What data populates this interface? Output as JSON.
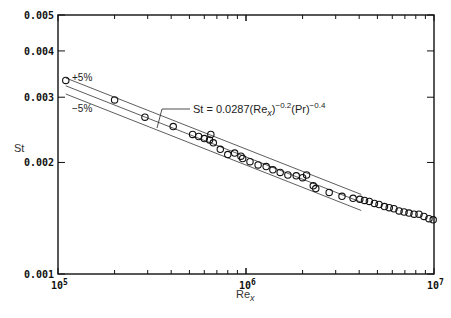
{
  "chart_data": {
    "type": "scatter",
    "title": "",
    "xlabel": "Re",
    "xlabel_sub": "x",
    "ylabel": "St",
    "xscale": "log",
    "yscale": "log",
    "xlim": [
      100000,
      10000000
    ],
    "ylim": [
      0.001,
      0.005
    ],
    "grid": false,
    "legend": null,
    "x_tick_labels": [
      {
        "value": 100000,
        "base": "10",
        "exp": "5"
      },
      {
        "value": 1000000,
        "base": "10",
        "exp": "6"
      },
      {
        "value": 10000000,
        "base": "10",
        "exp": "7"
      }
    ],
    "y_tick_labels": [
      {
        "value": 0.001,
        "label": "0.001"
      },
      {
        "value": 0.002,
        "label": "0.002"
      },
      {
        "value": 0.003,
        "label": "0.003"
      },
      {
        "value": 0.004,
        "label": "0.004"
      },
      {
        "value": 0.005,
        "label": "0.005"
      }
    ],
    "annotations": {
      "equation": "St = 0.0287(Re",
      "equation_sub": "x",
      "equation_exp1": "−0.2",
      "equation_mid": "(Pr)",
      "equation_exp2": "−0.4",
      "plus_band": "+5%",
      "minus_band": "−5%"
    },
    "lines": [
      {
        "name": "correlation",
        "x_range": [
          110000,
          4100000
        ],
        "st_at_start": 0.00322,
        "slope": -0.2
      },
      {
        "name": "+5%",
        "x_range": [
          110000,
          4100000
        ],
        "st_at_start": 0.00338,
        "slope": -0.2
      },
      {
        "name": "-5%",
        "x_range": [
          110000,
          4100000
        ],
        "st_at_start": 0.00306,
        "slope": -0.2
      }
    ],
    "series": [
      {
        "name": "data",
        "marker": "open-circle",
        "points": [
          [
            110000,
            0.00333
          ],
          [
            200000,
            0.00295
          ],
          [
            290000,
            0.00265
          ],
          [
            410000,
            0.0025
          ],
          [
            520000,
            0.00238
          ],
          [
            560000,
            0.00235
          ],
          [
            600000,
            0.00232
          ],
          [
            640000,
            0.0023
          ],
          [
            650000,
            0.00238
          ],
          [
            670000,
            0.00226
          ],
          [
            730000,
            0.00217
          ],
          [
            800000,
            0.0021
          ],
          [
            870000,
            0.00212
          ],
          [
            940000,
            0.00208
          ],
          [
            960000,
            0.00205
          ],
          [
            1050000,
            0.00201
          ],
          [
            1160000,
            0.00197
          ],
          [
            1280000,
            0.00195
          ],
          [
            1390000,
            0.00191
          ],
          [
            1520000,
            0.00188
          ],
          [
            1670000,
            0.00185
          ],
          [
            1850000,
            0.00184
          ],
          [
            2000000,
            0.00182
          ],
          [
            2100000,
            0.00185
          ],
          [
            2280000,
            0.00173
          ],
          [
            2350000,
            0.0017
          ],
          [
            2770000,
            0.00166
          ],
          [
            3240000,
            0.00162
          ],
          [
            3710000,
            0.0016
          ],
          [
            4030000,
            0.00159
          ],
          [
            4270000,
            0.00158
          ],
          [
            4530000,
            0.00157
          ],
          [
            4820000,
            0.00155
          ],
          [
            5100000,
            0.00154
          ],
          [
            5450000,
            0.00152
          ],
          [
            5780000,
            0.00151
          ],
          [
            6120000,
            0.0015
          ],
          [
            6520000,
            0.00148
          ],
          [
            6930000,
            0.00147
          ],
          [
            7360000,
            0.00146
          ],
          [
            7830000,
            0.00145
          ],
          [
            8320000,
            0.00145
          ],
          [
            8840000,
            0.00143
          ],
          [
            9400000,
            0.00141
          ],
          [
            9900000,
            0.0014
          ]
        ]
      }
    ]
  }
}
